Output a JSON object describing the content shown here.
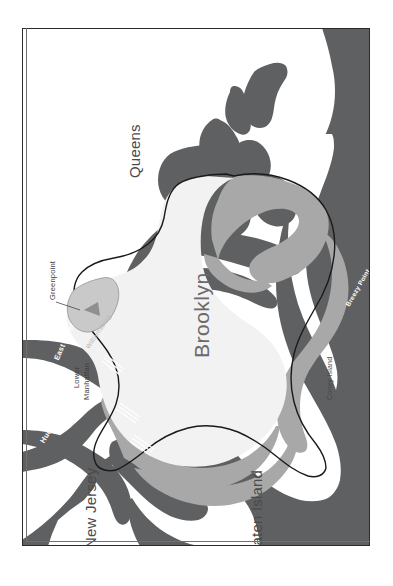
{
  "figure": {
    "kind": "reference-map",
    "orientation_note": "map plate printed rotated 90 degrees",
    "background_color": "#ffffff",
    "frame_color": "#2b2b2b"
  },
  "palette": {
    "water": "#5f6061",
    "land_outer": "#ffffff",
    "borough_fill": "#f2f2f2",
    "coastal_band": "#a8a8a8",
    "greenpoint_fill": "#c9c9c9",
    "boundary_line": "#1a1a1a",
    "bridge": "#ffffff"
  },
  "labels": {
    "boroughs": [
      {
        "name": "queens",
        "text": "Queens",
        "x": 126,
        "y": 178,
        "rotate": -90,
        "size": 15
      },
      {
        "name": "brooklyn",
        "text": "Brooklyn",
        "x": 190,
        "y": 358,
        "rotate": -90,
        "size": 21
      },
      {
        "name": "new-jersey",
        "text": "New Jersey",
        "x": 82,
        "y": 548,
        "rotate": -90,
        "size": 15
      },
      {
        "name": "staten-island",
        "text": "Staten Island",
        "x": 248,
        "y": 560,
        "rotate": -90,
        "size": 15
      }
    ],
    "places": [
      {
        "name": "greenpoint",
        "text": "Greenpoint",
        "x": 48,
        "y": 300,
        "rotate": -90,
        "size": 7.5,
        "style": "place"
      },
      {
        "name": "lower-manhattan-1",
        "text": "Lower",
        "x": 72,
        "y": 388,
        "rotate": -90,
        "size": 7.5,
        "style": "place"
      },
      {
        "name": "lower-manhattan-2",
        "text": "Manhattan",
        "x": 82,
        "y": 398,
        "rotate": -90,
        "size": 7.5,
        "style": "place"
      },
      {
        "name": "williamsburg",
        "text": "Williamsburg",
        "x": 84,
        "y": 330,
        "rotate": -60,
        "size": 6.5,
        "style": "faint"
      },
      {
        "name": "coney-island",
        "text": "Coney Island",
        "x": 326,
        "y": 390,
        "rotate": -90,
        "size": 7,
        "style": "coney"
      },
      {
        "name": "breezy-point",
        "text": "Breezy Point",
        "x": 344,
        "y": 300,
        "rotate": -62,
        "size": 6.5,
        "style": "breezy"
      }
    ],
    "waterways": [
      {
        "name": "east-river",
        "text": "East River",
        "x": 52,
        "y": 352,
        "rotate": -70,
        "size": 7.5
      },
      {
        "name": "hudson-river",
        "text": "Hudson River",
        "x": 38,
        "y": 432,
        "rotate": -62,
        "size": 7.5
      }
    ]
  },
  "leader_lines": [
    {
      "name": "greenpoint-leader",
      "x1": 56,
      "y1": 302,
      "x2": 76,
      "y2": 292
    }
  ],
  "features": {
    "water_bodies": [
      "Atlantic Ocean",
      "Lower New York Bay",
      "Jamaica Bay",
      "East River",
      "Hudson River"
    ],
    "bridge_count": 3
  }
}
